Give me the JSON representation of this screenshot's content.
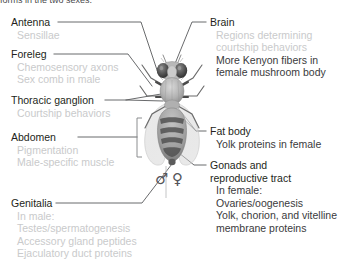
{
  "figure": {
    "caption_clipped": "forms in the two sexes.",
    "organism": "Drosophila melanogaster",
    "sex_symbols": {
      "male": "♂",
      "female": "♀"
    }
  },
  "colors": {
    "heading_text": "#231f20",
    "dim_text": "#c9cacb",
    "dark_subtext": "#3a3a3c",
    "leader_line": "#58595b",
    "bracket": "#808285",
    "background": "#ffffff"
  },
  "annotations_left": [
    {
      "id": "antenna",
      "heading": "Antenna",
      "items": [
        {
          "text": "Sensillae",
          "emphasis": "dim"
        }
      ]
    },
    {
      "id": "foreleg",
      "heading": "Foreleg",
      "items": [
        {
          "text": "Chemosensory axons",
          "emphasis": "dim"
        },
        {
          "text": "Sex comb in male",
          "emphasis": "dim"
        }
      ]
    },
    {
      "id": "thoracic-ganglion",
      "heading": "Thoracic ganglion",
      "items": [
        {
          "text": "Courtship behaviors",
          "emphasis": "dim"
        }
      ]
    },
    {
      "id": "abdomen",
      "heading": "Abdomen",
      "items": [
        {
          "text": "Pigmentation",
          "emphasis": "dim"
        },
        {
          "text": "Male-specific muscle",
          "emphasis": "dim"
        }
      ]
    },
    {
      "id": "genitalia",
      "heading": "Genitalia",
      "items": [
        {
          "text": "In male:",
          "emphasis": "dim"
        },
        {
          "text": "Testes/spermatogenesis",
          "emphasis": "dim"
        },
        {
          "text": "Accessory gland peptides",
          "emphasis": "dim"
        },
        {
          "text": "Ejaculatory duct proteins",
          "emphasis": "dim"
        }
      ]
    }
  ],
  "annotations_right": [
    {
      "id": "brain",
      "heading": "Brain",
      "heading2": "",
      "items": [
        {
          "text": "Regions determining",
          "emphasis": "dim"
        },
        {
          "text": "courtship behaviors",
          "emphasis": "dim"
        },
        {
          "text": "More Kenyon fibers in",
          "emphasis": "dark"
        },
        {
          "text": "female mushroom body",
          "emphasis": "dark"
        }
      ]
    },
    {
      "id": "fat-body",
      "heading": "Fat body",
      "heading2": "",
      "items": [
        {
          "text": "Yolk proteins in female",
          "emphasis": "dark"
        }
      ]
    },
    {
      "id": "gonads",
      "heading": "Gonads and",
      "heading2": "reproductive tract",
      "items": [
        {
          "text": "In female:",
          "emphasis": "dark"
        },
        {
          "text": "Ovaries/oogenesis",
          "emphasis": "dark"
        },
        {
          "text": "Yolk, chorion, and vitelline",
          "emphasis": "dark"
        },
        {
          "text": "membrane proteins",
          "emphasis": "dark"
        }
      ]
    }
  ]
}
